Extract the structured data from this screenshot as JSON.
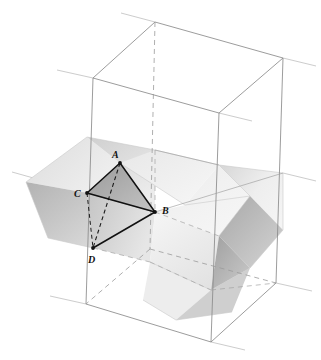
{
  "figure": {
    "kind": "3d-geometry-diagram",
    "background_color": "#ffffff",
    "canvas": {
      "width": 321,
      "height": 360
    }
  },
  "palette": {
    "cube_line": "#8a8a8a",
    "cube_line_hidden": "#9a9a9a",
    "construction_line": "#b0b0b0",
    "tetra_line": "#111111",
    "tetra_hidden_line": "#333333",
    "face_light": "#f2f2f2",
    "face_midlight": "#e3e3e3",
    "face_mid": "#d2d2d2",
    "face_dark": "#b4b4b4",
    "face_darker": "#9d9d9d",
    "tetra_face_fill": "#9c9c9c",
    "label_color": "#111111"
  },
  "cube": {
    "label": "bounding-cube",
    "vertices": {
      "top_back": {
        "x": 155,
        "y": 22
      },
      "top_left": {
        "x": 93,
        "y": 78
      },
      "top_right": {
        "x": 283,
        "y": 58
      },
      "top_front": {
        "x": 219,
        "y": 113
      },
      "bottom_back": {
        "x": 150,
        "y": 249
      },
      "bottom_left": {
        "x": 86,
        "y": 304
      },
      "bottom_right": {
        "x": 276,
        "y": 283
      },
      "bottom_front": {
        "x": 211,
        "y": 342
      }
    },
    "hidden_edges": [
      "top_back-bottom_back",
      "bottom_back-bottom_left",
      "bottom_back-bottom_right"
    ]
  },
  "solid": {
    "label": "inscribed-octahedral-solid",
    "note": "Large rhombic/octahedral body spanning the cube interior"
  },
  "tetrahedron": {
    "label": "tetrahedron-ABCD",
    "vertices": [
      {
        "name": "A",
        "label": "A",
        "x": 120,
        "y": 163,
        "label_x": 115,
        "label_y": 157
      },
      {
        "name": "B",
        "label": "B",
        "x": 155,
        "y": 212,
        "label_x": 163,
        "label_y": 211
      },
      {
        "name": "C",
        "label": "C",
        "x": 87,
        "y": 193,
        "label_x": 77,
        "label_y": 195
      },
      {
        "name": "D",
        "label": "D",
        "x": 93,
        "y": 248,
        "label_x": 91,
        "label_y": 261
      }
    ],
    "solid_edges": [
      "A-B",
      "A-C",
      "C-B",
      "B-D",
      "C-D"
    ],
    "hidden_edges": [
      "A-D"
    ],
    "shaded_face": "A-B-C"
  },
  "labels": {
    "a": "A",
    "b": "B",
    "c": "C",
    "d": "D"
  }
}
